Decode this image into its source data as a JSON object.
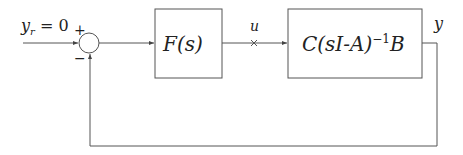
{
  "diagram": {
    "type": "block-diagram",
    "input_label": "y_r = 0",
    "input_var": "y",
    "input_sub": "r",
    "input_eq": "= 0",
    "sum_plus": "+",
    "sum_minus": "−",
    "controller_label": "F(s)",
    "signal_u_label": "u",
    "plant_label_pre": "C(sI-A)",
    "plant_label_sup": "−1",
    "plant_label_post": "B",
    "output_label": "y",
    "colors": {
      "line": "#555555",
      "text": "#222222",
      "background": "#ffffff"
    }
  }
}
